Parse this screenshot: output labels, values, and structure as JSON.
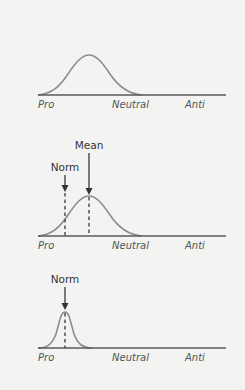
{
  "colors": {
    "background": "#f3f3f1",
    "axis": "#5a5a5a",
    "curve": "#8c8c8c",
    "marker": "#444444"
  },
  "axis_labels": {
    "pro": "Pro",
    "neutral": "Neutral",
    "anti": "Anti"
  },
  "panels": [
    {
      "id": "panel-1",
      "description": "Broad distribution centered between Pro and Neutral",
      "axis_labels": [
        "Pro",
        "Neutral",
        "Anti"
      ],
      "markers": []
    },
    {
      "id": "panel-2",
      "description": "Broad distribution with norm left of mean",
      "axis_labels": [
        "Pro",
        "Neutral",
        "Anti"
      ],
      "markers": [
        {
          "label": "Norm",
          "type": "dashed-arrow"
        },
        {
          "label": "Mean",
          "type": "dashed-arrow"
        }
      ]
    },
    {
      "id": "panel-3",
      "description": "Narrow distribution centered on norm",
      "axis_labels": [
        "Pro",
        "Neutral",
        "Anti"
      ],
      "markers": [
        {
          "label": "Norm",
          "type": "dashed-arrow"
        }
      ]
    }
  ]
}
